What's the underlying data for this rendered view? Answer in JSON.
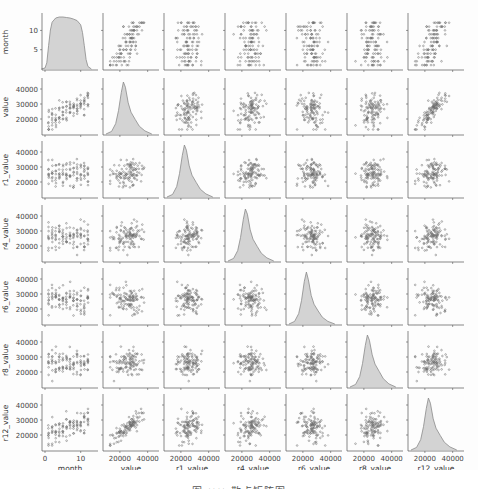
{
  "figure": {
    "caption": "图 ×× 散点矩阵图",
    "background": "#fdfdfd",
    "kde_fill": "#d3d3d3",
    "kde_line": "#8a8a8a",
    "marker_color": "#6a6a6a",
    "axis_color": "#555555"
  },
  "chart_data": {
    "type": "pairplot",
    "title": "",
    "variables": [
      "month",
      "value",
      "r1_value",
      "r4_value",
      "r6_value",
      "r8_value",
      "r12_value"
    ],
    "axis_ranges": {
      "month": [
        0,
        14
      ],
      "value": [
        10000,
        46000
      ],
      "r1_value": [
        10000,
        46000
      ],
      "r4_value": [
        10000,
        46000
      ],
      "r6_value": [
        10000,
        46000
      ],
      "r8_value": [
        10000,
        46000
      ],
      "r12_value": [
        10000,
        46000
      ]
    },
    "x_ticks": {
      "month": [
        0,
        10
      ],
      "value": [
        20000,
        40000
      ],
      "r1_value": [
        20000,
        40000
      ],
      "r4_value": [
        20000,
        40000
      ],
      "r6_value": [
        20000,
        40000
      ],
      "r8_value": [
        20000,
        40000
      ],
      "r12_value": [
        20000,
        40000
      ]
    },
    "y_ticks": {
      "month": [
        5,
        10
      ],
      "value": [
        20000,
        30000,
        40000
      ],
      "r1_value": [
        20000,
        30000,
        40000
      ],
      "r4_value": [
        20000,
        30000,
        40000
      ],
      "r6_value": [
        20000,
        30000,
        40000
      ],
      "r8_value": [
        20000,
        30000,
        40000
      ],
      "r12_value": [
        20000,
        30000,
        40000
      ]
    },
    "x_tick_labels": {
      "month": [
        "0",
        "10"
      ],
      "value": [
        "20000",
        "40000"
      ]
    },
    "y_tick_labels": {
      "month": [
        "5",
        "10"
      ],
      "value": [
        "20000",
        "30000",
        "40000"
      ]
    },
    "diagonal": {
      "type": "kde",
      "month": {
        "x": [
          -1,
          0,
          0.5,
          1,
          1.5,
          2,
          3,
          4,
          5,
          6,
          7,
          8,
          9,
          10,
          10.5,
          11,
          11.5,
          12,
          13
        ],
        "y": [
          0,
          0.02,
          0.12,
          0.45,
          0.75,
          0.9,
          0.98,
          1.0,
          1.0,
          0.99,
          0.98,
          0.96,
          0.93,
          0.85,
          0.7,
          0.45,
          0.18,
          0.05,
          0
        ]
      },
      "value": {
        "x": [
          10000,
          14000,
          17000,
          19000,
          21000,
          22500,
          24000,
          26000,
          28000,
          31000,
          34000,
          38000,
          43000
        ],
        "y": [
          0,
          0.05,
          0.2,
          0.45,
          0.8,
          1.0,
          0.9,
          0.6,
          0.42,
          0.28,
          0.15,
          0.06,
          0
        ]
      },
      "r1_value": {
        "x": [
          10000,
          14000,
          17000,
          19000,
          21000,
          22500,
          24000,
          26000,
          28000,
          31000,
          34000,
          38000,
          43000
        ],
        "y": [
          0,
          0.05,
          0.2,
          0.45,
          0.8,
          1.0,
          0.9,
          0.6,
          0.42,
          0.28,
          0.15,
          0.06,
          0
        ]
      },
      "r4_value": {
        "x": [
          10000,
          14000,
          17000,
          19000,
          21000,
          22500,
          24000,
          26000,
          28000,
          31000,
          34000,
          38000,
          43000
        ],
        "y": [
          0,
          0.05,
          0.2,
          0.45,
          0.8,
          1.0,
          0.9,
          0.6,
          0.42,
          0.28,
          0.15,
          0.06,
          0
        ]
      },
      "r6_value": {
        "x": [
          10000,
          14000,
          17000,
          19000,
          21000,
          22500,
          24000,
          26000,
          28000,
          31000,
          34000,
          38000,
          43000
        ],
        "y": [
          0,
          0.05,
          0.2,
          0.45,
          0.82,
          1.0,
          0.85,
          0.55,
          0.38,
          0.25,
          0.13,
          0.05,
          0
        ]
      },
      "r8_value": {
        "x": [
          10000,
          14000,
          17000,
          19000,
          21000,
          22500,
          24000,
          26000,
          28000,
          31000,
          34000,
          38000,
          43000
        ],
        "y": [
          0,
          0.05,
          0.2,
          0.45,
          0.8,
          1.0,
          0.9,
          0.62,
          0.44,
          0.3,
          0.16,
          0.06,
          0
        ]
      },
      "r12_value": {
        "x": [
          10000,
          14000,
          17000,
          19000,
          21000,
          22500,
          24000,
          26000,
          28000,
          31000,
          34000,
          38000,
          43000
        ],
        "y": [
          0,
          0.05,
          0.2,
          0.45,
          0.8,
          1.0,
          0.9,
          0.6,
          0.42,
          0.28,
          0.15,
          0.06,
          0
        ]
      }
    },
    "offdiagonal": {
      "type": "scatter",
      "n_points": 108,
      "month_values": [
        1,
        2,
        3,
        4,
        5,
        6,
        7,
        8,
        9,
        10,
        11,
        12
      ],
      "value_mean": 25000,
      "value_std": 5000,
      "value_trend_per_month": 1200,
      "correlations": {
        "value-r1_value": 0.35,
        "value-r4_value": 0.25,
        "value-r6_value": -0.15,
        "value-r8_value": 0.3,
        "value-r12_value": 0.85,
        "r1_value-r4_value": 0.0,
        "r1_value-r6_value": 0.0,
        "r1_value-r8_value": 0.1,
        "r1_value-r12_value": 0.3,
        "r4_value-r6_value": 0.0,
        "r4_value-r8_value": 0.1,
        "r4_value-r12_value": 0.2,
        "r6_value-r8_value": 0.1,
        "r6_value-r12_value": -0.1,
        "r8_value-r12_value": 0.25
      }
    },
    "grid": false,
    "legend": null
  },
  "layout": {
    "col_left": [
      45,
      106,
      167,
      228,
      289,
      350,
      411
    ],
    "col_width": 50,
    "row_top": [
      15,
      80,
      143,
      207,
      270,
      333,
      396
    ],
    "row_height": 54
  }
}
